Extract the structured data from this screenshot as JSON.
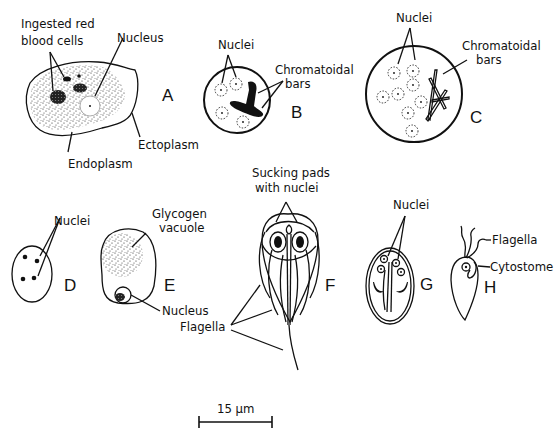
{
  "figure": {
    "panels": [
      {
        "id": "A",
        "letter": "A",
        "labels": {
          "rbc": [
            "Ingested red",
            "blood cells"
          ],
          "nucleus": "Nucleus",
          "ectoplasm": "Ectoplasm",
          "endoplasm": "Endoplasm"
        }
      },
      {
        "id": "B",
        "letter": "B",
        "labels": {
          "nuclei": "Nuclei",
          "bars": [
            "Chromatoidal",
            "bars"
          ]
        }
      },
      {
        "id": "C",
        "letter": "C",
        "labels": {
          "nuclei": "Nuclei",
          "bars": [
            "Chromatoidal",
            "bars"
          ]
        }
      },
      {
        "id": "D",
        "letter": "D",
        "labels": {
          "nuclei": "Nuclei"
        }
      },
      {
        "id": "E",
        "letter": "E",
        "labels": {
          "vacuole": [
            "Glycogen",
            "vacuole"
          ],
          "nucleus": "Nucleus"
        }
      },
      {
        "id": "F",
        "letter": "F",
        "labels": {
          "pads": [
            "Sucking pads",
            "with nuclei"
          ],
          "flagella": "Flagella"
        }
      },
      {
        "id": "G",
        "letter": "G",
        "labels": {
          "nuclei": "Nuclei"
        }
      },
      {
        "id": "H",
        "letter": "H",
        "labels": {
          "flagella": "Flagella",
          "cytostome": "Cytostome"
        }
      }
    ],
    "scale_bar": {
      "label": "15 μm",
      "value": 15,
      "unit": "μm"
    }
  }
}
